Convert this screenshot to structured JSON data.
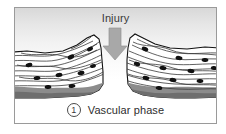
{
  "figure": {
    "title_label": "Injury",
    "caption_number": "1",
    "caption_text": "Vascular phase",
    "arrow": {
      "direction": "down",
      "color": "#a8a8a8",
      "semantic": "injury-force-arrow"
    },
    "frame": {
      "border_color": "#9a9a9a",
      "background_top": "#d8d8d8",
      "background_bottom": "#ffffff"
    }
  },
  "diagram": {
    "type": "histology-cross-section",
    "tissue_fill": "#ffffff",
    "tissue_outline": "#1a1a1a",
    "fiber_color": "#3a3a3a",
    "nucleus_color": "#111111",
    "basal_layer_color": "#8c8c8c",
    "basal_layer_dark": "#6e6e6e",
    "segments": [
      {
        "name": "left-tissue-flap",
        "side": "left",
        "nuclei_count": 9
      },
      {
        "name": "right-tissue-flap",
        "side": "right",
        "nuclei_count": 11
      }
    ],
    "wound_gap": {
      "name": "wound-cleft",
      "shape": "v-wedge",
      "fill": "#ffffff"
    }
  }
}
